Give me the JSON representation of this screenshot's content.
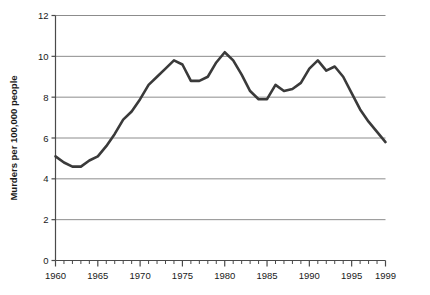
{
  "chart_data": {
    "type": "line",
    "title": "",
    "xlabel": "",
    "ylabel": "Murders per 100,000 people",
    "xlim": [
      1960,
      1999
    ],
    "ylim": [
      0,
      12
    ],
    "grid": true,
    "legend": "none",
    "x_tick_labels": [
      "1960",
      "1965",
      "1970",
      "1975",
      "1980",
      "1985",
      "1990",
      "1995",
      "1999"
    ],
    "x_tick_values": [
      1960,
      1965,
      1970,
      1975,
      1980,
      1985,
      1990,
      1995,
      1999
    ],
    "y_tick_labels": [
      "0",
      "2",
      "4",
      "6",
      "8",
      "10",
      "12"
    ],
    "y_tick_values": [
      0,
      2,
      4,
      6,
      8,
      10,
      12
    ],
    "x_minor_tick_step": 1,
    "series": [
      {
        "name": "Murder rate",
        "color": "#3a3a3a",
        "line_width": 2.6,
        "x": [
          1960,
          1961,
          1962,
          1963,
          1964,
          1965,
          1966,
          1967,
          1968,
          1969,
          1970,
          1971,
          1972,
          1973,
          1974,
          1975,
          1976,
          1977,
          1978,
          1979,
          1980,
          1981,
          1982,
          1983,
          1984,
          1985,
          1986,
          1987,
          1988,
          1989,
          1990,
          1991,
          1992,
          1993,
          1994,
          1995,
          1996,
          1997,
          1998,
          1999
        ],
        "values": [
          5.1,
          4.8,
          4.6,
          4.6,
          4.9,
          5.1,
          5.6,
          6.2,
          6.9,
          7.3,
          7.9,
          8.6,
          9.0,
          9.4,
          9.8,
          9.6,
          8.8,
          8.8,
          9.0,
          9.7,
          10.2,
          9.8,
          9.1,
          8.3,
          7.9,
          7.9,
          8.6,
          8.3,
          8.4,
          8.7,
          9.4,
          9.8,
          9.3,
          9.5,
          9.0,
          8.2,
          7.4,
          6.8,
          6.3,
          5.8
        ]
      }
    ]
  },
  "axis_label": {
    "y": "Murders per 100,000 people"
  }
}
